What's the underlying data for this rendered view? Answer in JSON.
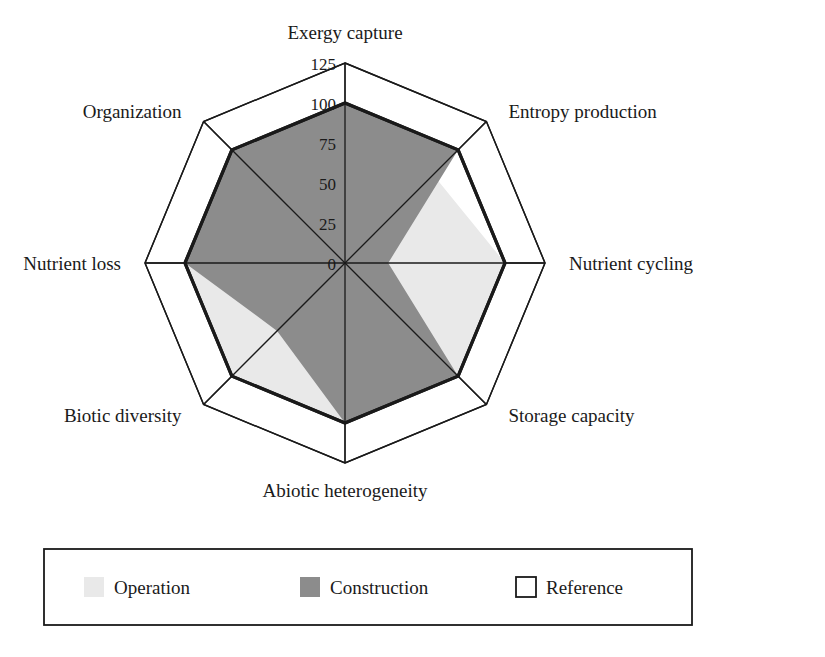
{
  "figure": {
    "type": "radar-chart",
    "background": "#ffffff"
  },
  "chart_data": {
    "type": "radar",
    "title": "",
    "xlabel": "",
    "ylabel": "",
    "grid": true,
    "legend_position": "bottom",
    "rlim": [
      0,
      125
    ],
    "ticks": [
      "0",
      "25",
      "50",
      "75",
      "100",
      "125"
    ],
    "tick_values": [
      0,
      25,
      50,
      75,
      100,
      125
    ],
    "categories": [
      "Exergy capture",
      "Entropy production",
      "Nutrient cycling",
      "Storage capacity",
      "Abiotic heterogeneity",
      "Biotic diversity",
      "Nutrient loss",
      "Organization"
    ],
    "series": [
      {
        "name": "Operation",
        "color": "#e9e9e9",
        "edge": "#e9e9e9",
        "values": [
          52,
          78,
          100,
          100,
          100,
          100,
          100,
          100
        ]
      },
      {
        "name": "Construction",
        "color": "#8c8c8c",
        "edge": "#8c8c8c",
        "values": [
          100,
          100,
          27,
          100,
          100,
          60,
          100,
          100
        ]
      },
      {
        "name": "Reference",
        "color": "#ffffff",
        "edge": "#1a1a1a",
        "values": [
          100,
          100,
          100,
          100,
          100,
          100,
          100,
          100
        ]
      }
    ]
  },
  "legend": {
    "items": [
      {
        "label": "Operation",
        "swatch": "#e9e9e9",
        "outlined": false
      },
      {
        "label": "Construction",
        "swatch": "#8c8c8c",
        "outlined": false
      },
      {
        "label": "Reference",
        "swatch": "#ffffff",
        "outlined": true
      }
    ]
  }
}
